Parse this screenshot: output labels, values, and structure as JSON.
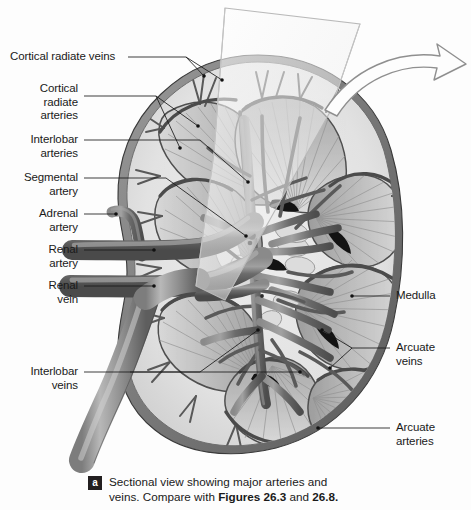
{
  "figure": {
    "background_color": "#fdfdfd",
    "ink_color": "#1a1a1a",
    "cortex_color": "#e3e3e3",
    "medulla_color": "#b9b9b9",
    "vessel_color": "#6f6f6f",
    "vessel_dark_color": "#4a4a4a",
    "capsule_color": "#555555"
  },
  "labels": {
    "left": [
      {
        "id": "cortical-radiate-veins",
        "text": "Cortical radiate veins"
      },
      {
        "id": "cortical-radiate-arteries",
        "text": "Cortical\nradiate\narteries"
      },
      {
        "id": "interlobar-arteries",
        "text": "Interlobar\narteries"
      },
      {
        "id": "segmental-artery",
        "text": "Segmental\nartery"
      },
      {
        "id": "adrenal-artery",
        "text": "Adrenal\nartery"
      },
      {
        "id": "renal-artery",
        "text": "Renal\nartery"
      },
      {
        "id": "renal-vein",
        "text": "Renal\nvein"
      },
      {
        "id": "interlobar-veins",
        "text": "Interlobar\nveins"
      }
    ],
    "right": [
      {
        "id": "medulla",
        "text": "Medulla"
      },
      {
        "id": "arcuate-veins",
        "text": "Arcuate\nveins"
      },
      {
        "id": "arcuate-arteries",
        "text": "Arcuate\narteries"
      }
    ]
  },
  "caption": {
    "badge": "a",
    "line1": "Sectional view showing major arteries and",
    "line2_prefix": "veins. Compare with ",
    "line2_bold": "Figures 26.3",
    "line2_mid": " and ",
    "line2_bold2": "26.8.",
    "full": "Sectional view showing major arteries and veins. Compare with Figures 26.3 and 26.8."
  }
}
